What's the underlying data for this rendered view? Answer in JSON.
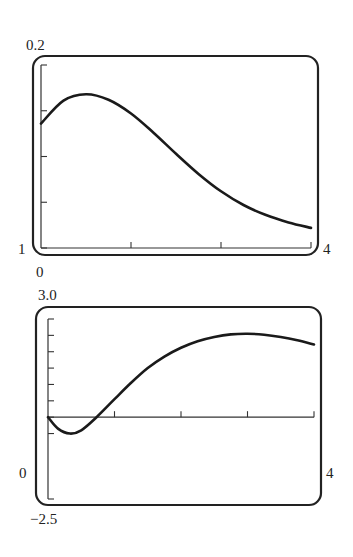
{
  "chart_data": [
    {
      "type": "line",
      "title": "",
      "xlabel": "",
      "ylabel": "",
      "xlim": [
        1,
        4
      ],
      "ylim": [
        0,
        0.2
      ],
      "grid": false,
      "x_ticks": [
        1,
        2,
        3,
        4
      ],
      "y_ticks": [
        0,
        0.05,
        0.1,
        0.15,
        0.2
      ],
      "labels": {
        "ymax": "0.2",
        "xmin": "1",
        "xmax": "4",
        "ymin": "0"
      },
      "series": [
        {
          "name": "curve",
          "x": [
            1.0,
            1.25,
            1.5,
            1.75,
            2.0,
            2.25,
            2.5,
            2.75,
            3.0,
            3.25,
            3.5,
            3.75,
            4.0
          ],
          "y": [
            0.136,
            0.161,
            0.168,
            0.162,
            0.147,
            0.126,
            0.103,
            0.081,
            0.062,
            0.047,
            0.036,
            0.028,
            0.022
          ]
        }
      ]
    },
    {
      "type": "line",
      "title": "",
      "xlabel": "",
      "ylabel": "",
      "xlim": [
        0,
        4
      ],
      "ylim": [
        -2.5,
        3.0
      ],
      "grid": false,
      "x_ticks": [
        0,
        1,
        2,
        3,
        4
      ],
      "y_ticks": [
        -0.5,
        0,
        0.5,
        1.0,
        1.5,
        2.0,
        2.5,
        3.0
      ],
      "labels": {
        "ymax": "3.0",
        "xmin": "0",
        "xmax": "4",
        "ymin": "−2.5"
      },
      "series": [
        {
          "name": "curve",
          "x": [
            0.0,
            0.15,
            0.33,
            0.5,
            0.73,
            1.0,
            1.25,
            1.5,
            1.75,
            2.0,
            2.25,
            2.5,
            2.75,
            3.0,
            3.25,
            3.5,
            3.75,
            4.0
          ],
          "y": [
            0.0,
            -0.35,
            -0.5,
            -0.4,
            0.0,
            0.55,
            1.05,
            1.5,
            1.85,
            2.12,
            2.32,
            2.45,
            2.53,
            2.55,
            2.52,
            2.45,
            2.35,
            2.22
          ]
        }
      ]
    }
  ]
}
